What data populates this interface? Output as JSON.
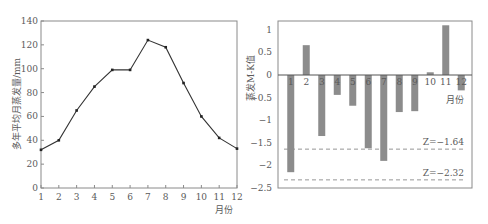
{
  "chart_data": [
    {
      "type": "line",
      "title": "",
      "xlabel": "月份",
      "ylabel": "多年平均月蒸发量/mm",
      "categories": [
        "1",
        "2",
        "3",
        "4",
        "5",
        "6",
        "7",
        "8",
        "9",
        "10",
        "11",
        "12"
      ],
      "values": [
        32,
        40,
        65,
        85,
        99,
        99,
        124,
        118,
        88,
        60,
        42,
        33
      ],
      "yticks": [
        "0",
        "20",
        "40",
        "60",
        "80",
        "100",
        "120",
        "140"
      ],
      "ylim": [
        0,
        140
      ],
      "grid": false,
      "marker": "square",
      "color": "#333333"
    },
    {
      "type": "bar",
      "title": "",
      "xlabel": "月份",
      "ylabel": "蒸发M-K值",
      "categories": [
        "1",
        "2",
        "3",
        "4",
        "5",
        "6",
        "7",
        "8",
        "9",
        "10",
        "11",
        "12"
      ],
      "values": [
        -2.15,
        0.66,
        -1.35,
        -0.44,
        -0.68,
        -1.62,
        -1.9,
        -0.82,
        -0.8,
        0.06,
        1.1,
        -0.34
      ],
      "yticks": [
        "1",
        "0.5",
        "0",
        "-0.5",
        "-1",
        "-1.5",
        "-2",
        "-2.5"
      ],
      "ylim": [
        -2.5,
        1.2
      ],
      "grid": false,
      "bar_color": "#8c8c8c",
      "reference_lines": [
        {
          "value": -1.64,
          "label": "Z=−1.64",
          "style": "dashed"
        },
        {
          "value": -2.32,
          "label": "Z=−2.32",
          "style": "dashed"
        }
      ]
    }
  ]
}
